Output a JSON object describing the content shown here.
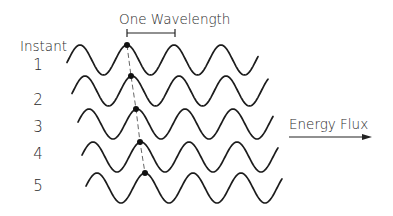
{
  "figure": {
    "wavelength_label": "One Wavelength",
    "axis_label": "Instant",
    "instants": [
      "1",
      "2",
      "3",
      "4",
      "5"
    ],
    "energy_label": "Energy Flux",
    "icons": {
      "arrow": "right-arrow-icon",
      "marker": "crest-marker-dot"
    }
  },
  "waves": [
    {
      "instant": "1",
      "start_x": 67,
      "center_y": 60,
      "amplitude": 15,
      "wavelength": 47,
      "first_crest_x": 80,
      "end_x": 258,
      "marker_x": 127
    },
    {
      "instant": "2",
      "start_x": 72,
      "center_y": 91,
      "amplitude": 15,
      "wavelength": 47,
      "first_crest_x": 85,
      "end_x": 268,
      "marker_x": 131
    },
    {
      "instant": "3",
      "start_x": 78,
      "center_y": 124,
      "amplitude": 15,
      "wavelength": 48,
      "first_crest_x": 89,
      "end_x": 273,
      "marker_x": 136
    },
    {
      "instant": "4",
      "start_x": 82,
      "center_y": 157,
      "amplitude": 15,
      "wavelength": 48,
      "first_crest_x": 93,
      "end_x": 278,
      "marker_x": 140
    },
    {
      "instant": "5",
      "start_x": 86,
      "center_y": 188,
      "amplitude": 15,
      "wavelength": 48,
      "first_crest_x": 97,
      "end_x": 282,
      "marker_x": 145
    }
  ]
}
